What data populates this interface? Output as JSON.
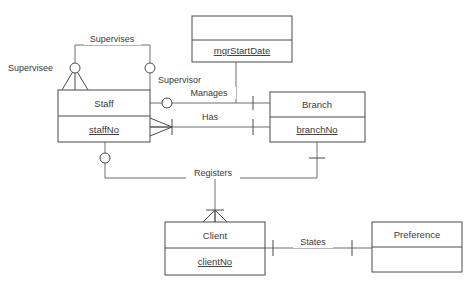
{
  "diagram": {
    "type": "entity-relationship-diagram",
    "notation": "crows-foot",
    "background_color": "#ffffff",
    "line_color": "#6e6e6e",
    "box_stroke_color": "#4a4a4a",
    "text_color": "#3a3a3a"
  },
  "entities": [
    {
      "id": "staff",
      "name": "Staff",
      "attribute": "staffNo",
      "attribute_is_primary_key": true,
      "x": 58,
      "y": 90,
      "width": 92,
      "height": 52,
      "divider_y": 116
    },
    {
      "id": "branch",
      "name": "Branch",
      "attribute": "branchNo",
      "attribute_is_primary_key": true,
      "x": 270,
      "y": 92,
      "width": 95,
      "height": 50,
      "divider_y": 117
    },
    {
      "id": "client",
      "name": "Client",
      "attribute": "clientNo",
      "attribute_is_primary_key": true,
      "x": 165,
      "y": 222,
      "width": 100,
      "height": 53,
      "divider_y": 248
    },
    {
      "id": "preference",
      "name": "Preference",
      "attribute": "",
      "attribute_is_primary_key": false,
      "x": 372,
      "y": 222,
      "width": 90,
      "height": 50,
      "divider_y": 247
    },
    {
      "id": "mgr_start_date",
      "name": "",
      "attribute": "mgrStartDate",
      "attribute_is_primary_key": false,
      "x": 192,
      "y": 16,
      "width": 100,
      "height": 46,
      "divider_y": 40
    }
  ],
  "relationships": [
    {
      "id": "supervises",
      "label": "Supervises",
      "x": 112,
      "y": 41
    },
    {
      "id": "manages",
      "label": "Manages",
      "x": 209,
      "y": 94
    },
    {
      "id": "has",
      "label": "Has",
      "x": 209,
      "y": 118
    },
    {
      "id": "registers",
      "label": "Registers",
      "x": 212,
      "y": 175
    },
    {
      "id": "states",
      "label": "States",
      "x": 313,
      "y": 243
    }
  ],
  "roles": [
    {
      "id": "supervisee",
      "label": "Supervisee",
      "x": 8,
      "y": 70
    },
    {
      "id": "supervisor",
      "label": "Supervisor",
      "x": 158,
      "y": 82
    }
  ],
  "cardinality_markers": [
    {
      "type": "optional-circle",
      "near": "supervisee",
      "cx": 75,
      "cy": 68
    },
    {
      "type": "crows-foot",
      "near": "supervisee",
      "apex_x": 75,
      "apex_y": 68
    },
    {
      "type": "optional-circle",
      "near": "supervisor",
      "cx": 150,
      "cy": 68
    },
    {
      "type": "optional-circle",
      "near": "manages-staff",
      "cx": 167,
      "cy": 103
    },
    {
      "type": "one-bar",
      "near": "manages-branch",
      "x": 253,
      "y": 103
    },
    {
      "type": "crows-foot",
      "near": "has-staff",
      "apex_x": 172,
      "apex_y": 127
    },
    {
      "type": "one-bar",
      "near": "has-staff",
      "x": 172,
      "y": 127
    },
    {
      "type": "one-bar",
      "near": "has-branch",
      "x": 253,
      "y": 127
    },
    {
      "type": "optional-circle",
      "near": "registers-staff",
      "cx": 105,
      "cy": 158
    },
    {
      "type": "one-bar",
      "near": "registers-branch",
      "x": 317,
      "y": 158
    },
    {
      "type": "crows-foot",
      "near": "registers-client",
      "apex_x": 215,
      "apex_y": 210
    },
    {
      "type": "one-bar",
      "near": "registers-client",
      "x": 215,
      "y": 210
    },
    {
      "type": "one-bar",
      "near": "states-client",
      "x": 273,
      "y": 248
    },
    {
      "type": "one-bar",
      "near": "states-preference",
      "x": 352,
      "y": 248
    }
  ],
  "labels": {
    "supervises": "Supervises",
    "supervisee": "Supervisee",
    "supervisor": "Supervisor",
    "manages": "Manages",
    "has": "Has",
    "registers": "Registers",
    "states": "States",
    "staff": "Staff",
    "staff_no": "staffNo",
    "branch": "Branch",
    "branch_no": "branchNo",
    "client": "Client",
    "client_no": "clientNo",
    "preference": "Preference",
    "mgr_start_date": "mgrStartDate"
  }
}
